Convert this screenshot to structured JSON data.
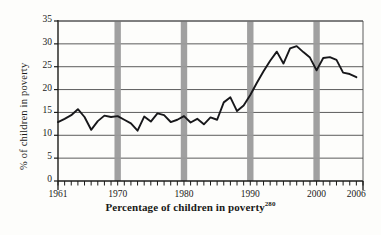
{
  "figure": {
    "caption": "Percentage of children in poverty",
    "caption_superscript": "280",
    "y_axis_title": "% of children in poverty",
    "background_color": "#fdfdfb",
    "line_color": "#17171a",
    "gridline_color": "#4a4a4a",
    "band_color": "#9b9b9b",
    "axis_color": "#1a1a18"
  },
  "chart_data": {
    "type": "line",
    "title": "Percentage of children in poverty",
    "xlabel": "",
    "ylabel": "% of children in poverty",
    "xlim": [
      1961,
      2007
    ],
    "ylim": [
      0,
      35
    ],
    "grid": true,
    "legend": "none",
    "y_ticks": [
      0,
      5,
      10,
      15,
      20,
      25,
      30,
      35
    ],
    "y_tick_labels": [
      "0",
      "5",
      "10",
      "15",
      "20",
      "25",
      "30",
      "35"
    ],
    "x_tick_labels": [
      "1961",
      "1970",
      "1980",
      "1990",
      "2000",
      "2006"
    ],
    "x_tick_values": [
      1961,
      1970,
      1980,
      1990,
      2000,
      2006
    ],
    "x_minor_ticks_every": 1,
    "annotations": [
      {
        "type": "vertical-band",
        "label": "1970",
        "x": 1970
      },
      {
        "type": "vertical-band",
        "label": "1980",
        "x": 1980
      },
      {
        "type": "vertical-band",
        "label": "1990",
        "x": 1990
      },
      {
        "type": "vertical-band",
        "label": "2000",
        "x": 2000
      }
    ],
    "x": [
      1961,
      1962,
      1963,
      1964,
      1965,
      1966,
      1967,
      1968,
      1969,
      1970,
      1971,
      1972,
      1973,
      1974,
      1975,
      1976,
      1977,
      1978,
      1979,
      1980,
      1981,
      1982,
      1983,
      1984,
      1985,
      1986,
      1987,
      1988,
      1989,
      1990,
      1991,
      1992,
      1993,
      1994,
      1995,
      1996,
      1997,
      1998,
      1999,
      2000,
      2001,
      2002,
      2003,
      2004,
      2005,
      2006
    ],
    "series": [
      {
        "name": "% of children in poverty",
        "values": [
          12.9,
          13.6,
          14.4,
          15.7,
          14.0,
          11.2,
          13.1,
          14.3,
          14.0,
          14.2,
          13.4,
          12.6,
          11.0,
          14.1,
          13.0,
          14.8,
          14.4,
          12.9,
          13.4,
          14.2,
          12.8,
          13.6,
          12.4,
          13.9,
          13.4,
          17.2,
          18.3,
          15.3,
          16.5,
          18.8,
          21.5,
          24.0,
          26.3,
          28.3,
          25.7,
          29.0,
          29.5,
          28.2,
          27.0,
          24.2,
          26.9,
          27.1,
          26.5,
          23.7,
          23.4,
          22.7
        ]
      }
    ]
  }
}
